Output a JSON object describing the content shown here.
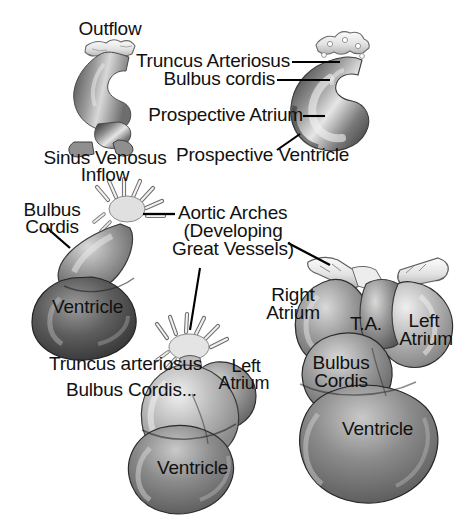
{
  "figure": {
    "type": "anatomical-diagram",
    "palette": {
      "background": "#ffffff",
      "text": "#111111",
      "leader_line": "#000000",
      "tissue_dark": "#3a3a3a",
      "tissue_mid": "#8d8d8d",
      "tissue_light": "#e2e2e2",
      "vessel_outline": "#555555"
    }
  },
  "stage1": {
    "name": "heart-tube",
    "labels": {
      "outflow": "Outflow",
      "sinus_venosus_line1": "Sinus Venosus",
      "sinus_venosus_line2": "Inflow"
    }
  },
  "stage2": {
    "name": "looping-heart",
    "labels": {
      "truncus_arteriosus": "Truncus Arteriosus",
      "bulbus_cordis": "Bulbus cordis",
      "prospective_atrium": "Prospective Atrium",
      "prospective_ventricle": "Prospective Ventricle"
    }
  },
  "stage3": {
    "name": "bulboventricular-loop",
    "labels": {
      "bulbus_line1": "Bulbus",
      "bulbus_line2": "Cordis",
      "ventricle": "Ventricle",
      "aortic_arches_line1": "Aortic Arches",
      "aortic_arches_line2": "(Developing",
      "aortic_arches_line3": "Great Vessels)"
    }
  },
  "stage4": {
    "name": "chambered-heart",
    "labels": {
      "truncus_arteriosus": "Truncus arteriosus",
      "bulbus_cordis": "Bulbus Cordis...",
      "left_atrium_line1": "Left",
      "left_atrium_line2": "Atrium",
      "ventricle": "Ventricle"
    }
  },
  "stage5": {
    "name": "near-mature-heart",
    "labels": {
      "right_atrium_line1": "Right",
      "right_atrium_line2": "Atrium",
      "truncus_arteriosus_abbrev": "T.A.",
      "left_atrium_line1": "Left",
      "left_atrium_line2": "Atrium",
      "bulbus_cordis_line1": "Bulbus",
      "bulbus_cordis_line2": "Cordis",
      "ventricle": "Ventricle"
    }
  }
}
